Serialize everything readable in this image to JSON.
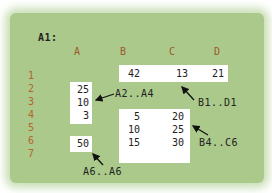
{
  "title": "A1:",
  "columns": [
    "A",
    "B",
    "C",
    "D"
  ],
  "rows": [
    "1",
    "2",
    "3",
    "4",
    "5",
    "6",
    "7"
  ],
  "ranges": {
    "b1_d1": {
      "label": "B1..D1",
      "values": [
        "42",
        "13",
        "21"
      ]
    },
    "a2_a4": {
      "label": "A2..A4",
      "values": [
        "25",
        "10",
        "3"
      ]
    },
    "b4_c6": {
      "label": "B4..C6",
      "values": [
        [
          "5",
          "20"
        ],
        [
          "10",
          "25"
        ],
        [
          "15",
          "30"
        ]
      ]
    },
    "a6_a6": {
      "label": "A6..A6",
      "values": [
        "50"
      ]
    }
  },
  "colors": {
    "panel": "#aac98b",
    "header": "#a0572a",
    "row_number": "#b4652f"
  }
}
